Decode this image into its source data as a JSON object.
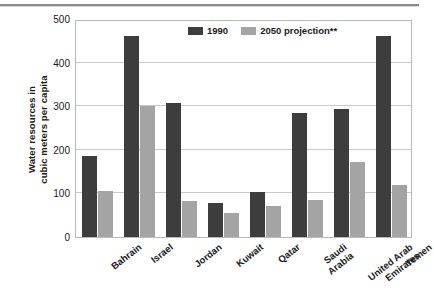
{
  "chart_data": {
    "type": "bar",
    "title": "",
    "xlabel": "",
    "ylabel_lines": [
      "Water resources in",
      "cubic meters per capita"
    ],
    "ylim": [
      0,
      500
    ],
    "yticks": [
      0,
      100,
      200,
      300,
      400,
      500
    ],
    "grid": true,
    "legend_position": "top-center",
    "categories": [
      "Bahrain",
      "Israel",
      "Jordan",
      "Kuwait",
      "Qatar",
      "Saudi Arabia",
      "United Arab Emirates",
      "Yemen"
    ],
    "category_label_lines": [
      [
        "Bahrain"
      ],
      [
        "Israel"
      ],
      [
        "Jordan"
      ],
      [
        "Kuwait"
      ],
      [
        "Qatar"
      ],
      [
        "Saudi",
        "Arabia"
      ],
      [
        "United Arab",
        "Emirates"
      ],
      [
        "Yemen"
      ]
    ],
    "series": [
      {
        "name": "1990",
        "color": "#3d3d3d",
        "values": [
          185,
          462,
          308,
          77,
          104,
          285,
          294,
          460
        ]
      },
      {
        "name": "2050 projection**",
        "color": "#a4a4a4",
        "values": [
          105,
          300,
          82,
          55,
          70,
          85,
          172,
          120
        ]
      }
    ]
  },
  "legend": {
    "entries": [
      {
        "label": "1990",
        "swatch": "s1990"
      },
      {
        "label": "2050 projection**",
        "swatch": "s2050"
      }
    ]
  }
}
